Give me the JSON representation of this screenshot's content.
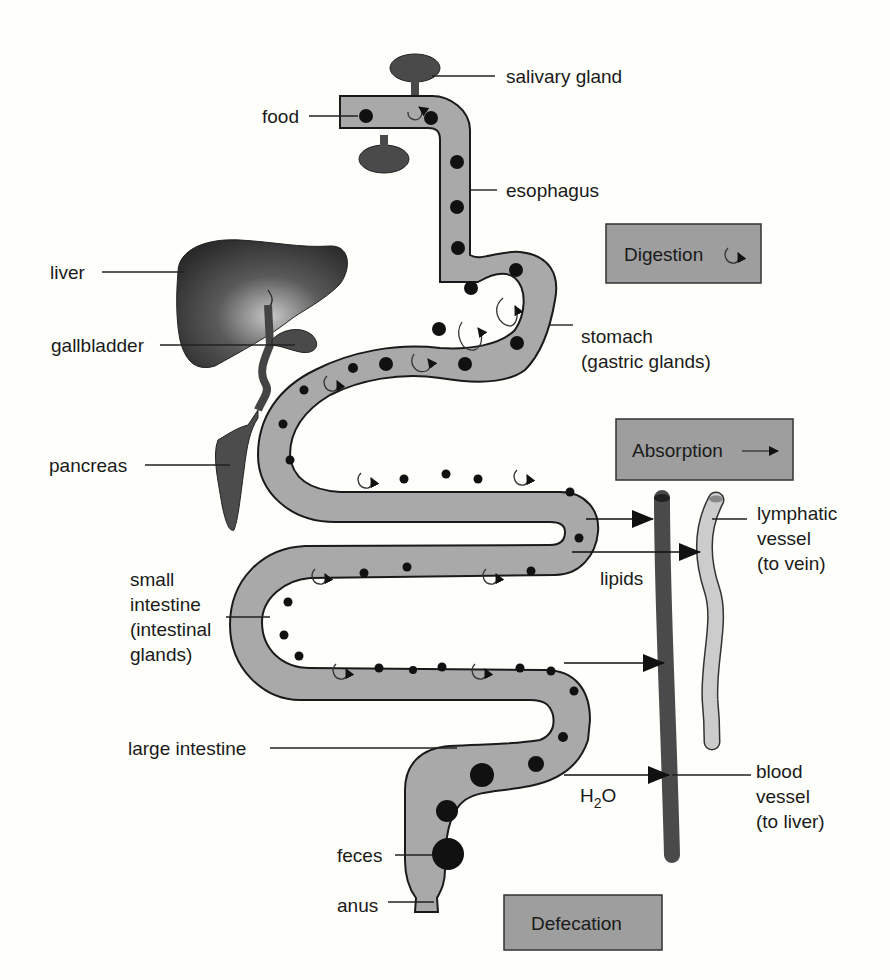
{
  "top_caption_fragment": "...g g...",
  "labels": {
    "salivary_gland": "salivary gland",
    "food": "food",
    "esophagus": "esophagus",
    "liver": "liver",
    "gallbladder": "gallbladder",
    "stomach_line1": "stomach",
    "stomach_line2": "(gastric glands)",
    "pancreas": "pancreas",
    "lymphatic_line1": "lymphatic",
    "lymphatic_line2": "vessel",
    "lymphatic_line3": "(to vein)",
    "lipids": "lipids",
    "small_int_line1": "small",
    "small_int_line2": "intestine",
    "small_int_line3": "(intestinal",
    "small_int_line4": "glands)",
    "large_intestine": "large intestine",
    "h2o_h": "H",
    "h2o_sub": "2",
    "h2o_o": "O",
    "blood_line1": "blood",
    "blood_line2": "vessel",
    "blood_line3": "(to liver)",
    "feces": "feces",
    "anus": "anus"
  },
  "process_boxes": {
    "digestion": {
      "label": "Digestion",
      "icon": "circular-arrow-icon"
    },
    "absorption": {
      "label": "Absorption",
      "icon": "right-arrow-icon"
    },
    "defecation": {
      "label": "Defecation"
    }
  },
  "colors": {
    "background": "#fefefa",
    "tract_fill": "#a9a9a9",
    "box_fill": "#9e9e9e",
    "liver_fill": "#3a3a3a",
    "blood_vessel": "#4a4a4a",
    "lymph_vessel": "#c9c9c9",
    "food_particle": "#111111"
  }
}
